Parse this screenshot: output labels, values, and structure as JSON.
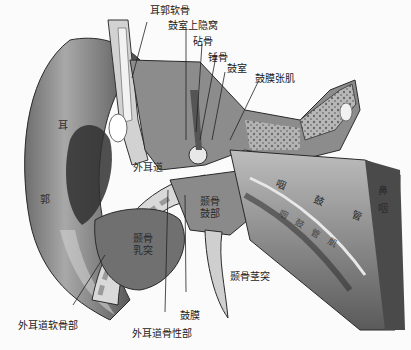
{
  "figure": {
    "colors": {
      "background": "#fbfbfb",
      "ink": "#1a1a1a",
      "tissue_dark": "#3a3a3a",
      "tissue_mid": "#8a8a8a",
      "tissue_light": "#d8d8d8",
      "cartilage": "#c9c9c9"
    }
  },
  "labels": {
    "auricle_cartilage": "耳郭软骨",
    "epitympanic_recess": "鼓室上隐窝",
    "incus": "砧骨",
    "malleus": "锤骨",
    "tympanic_cavity": "鼓室",
    "tensor_tympani": "鼓膜张肌",
    "auricle_1": "耳",
    "auricle_2": "郭",
    "external_canal": "外耳道",
    "tympanic_part": "颞骨鼓部",
    "mastoid": "颞骨乳突",
    "pharyngotympanic_tube": "咽 鼓 管",
    "lower_band": "咽鼓管肌",
    "nasopharynx": "鼻咽",
    "styloid_process": "颞骨茎突",
    "tympanic_membrane": "鼓膜",
    "cartilaginous_canal": "外耳道软骨部",
    "bony_canal": "外耳道骨性部"
  }
}
